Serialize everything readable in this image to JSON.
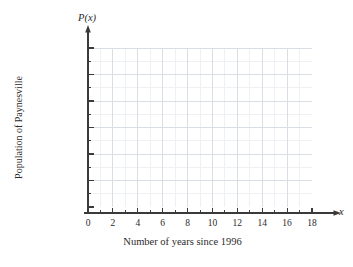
{
  "chart_data": {
    "type": "line",
    "title": "",
    "subtitle": "",
    "xlabel": "Number of years since 1996",
    "ylabel": "Population of Paynesville",
    "x_axis_name": "x",
    "y_axis_name": "P(x)",
    "xlim": [
      0,
      18
    ],
    "ylim": [
      17750,
      24250
    ],
    "x_major_ticks": [
      0,
      2,
      4,
      6,
      8,
      10,
      12,
      14,
      16,
      18
    ],
    "x_major_tick_labels": [
      "0",
      "2",
      "4",
      "6",
      "8",
      "10",
      "12",
      "14",
      "16",
      "18"
    ],
    "x_minor_tick_step": 1,
    "y_major_ticks": [
      18000,
      19000,
      20000,
      21000,
      22000,
      23000,
      24000
    ],
    "y_major_tick_labels": [
      "18,000",
      "19,000",
      "20,000",
      "21,000",
      "22,000",
      "23,000",
      "24,000"
    ],
    "y_minor_tick_step": 500,
    "grid": true,
    "grid_major_color": "#d9dde6",
    "grid_minor_color": "#eef0f4",
    "axis_color": "#3a3a3a",
    "background_color": "#ffffff",
    "legend": [],
    "series": [],
    "annotations": []
  },
  "axis": {
    "y_name": "P(x)",
    "x_name": "x",
    "y_title": "Population of Paynesville",
    "x_title": "Number of years since 1996"
  }
}
